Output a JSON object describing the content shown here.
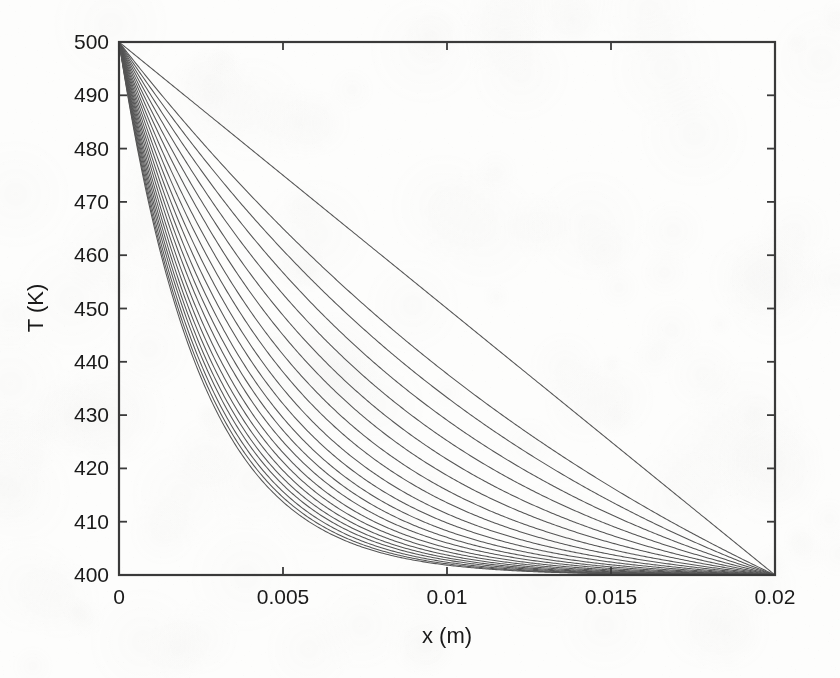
{
  "figure": {
    "background_color": "#fdfdfc",
    "axis_color": "#3a3a3a",
    "curve_color": "#555555",
    "text_color": "#1a1a1a"
  },
  "chart_data": {
    "type": "line",
    "title": "",
    "xlabel": "x (m)",
    "ylabel": "T (K)",
    "xlim": [
      0,
      0.02
    ],
    "ylim": [
      400,
      500
    ],
    "xticks": [
      0,
      0.005,
      0.01,
      0.015,
      0.02
    ],
    "xtick_labels": [
      "0",
      "0.005",
      "0.01",
      "0.015",
      "0.02"
    ],
    "yticks": [
      400,
      410,
      420,
      430,
      440,
      450,
      460,
      470,
      480,
      490,
      500
    ],
    "ytick_labels": [
      "400",
      "410",
      "420",
      "430",
      "440",
      "450",
      "460",
      "470",
      "480",
      "490",
      "500"
    ],
    "grid": false,
    "legend": null,
    "tick_direction": "in",
    "box": true,
    "n_curves": 22,
    "series": [
      {
        "name": "curve-1",
        "shape": "exponential-decay",
        "steepness": 1.0,
        "x": [
          0,
          0.001,
          0.002,
          0.003,
          0.004,
          0.005,
          0.006,
          0.007,
          0.008,
          0.009,
          0.01,
          0.012,
          0.014,
          0.016,
          0.018,
          0.02
        ],
        "values": [
          500.0,
          474.8,
          455.3,
          440.2,
          428.7,
          420.0,
          413.6,
          409.0,
          405.7,
          403.4,
          401.9,
          400.5,
          400.1,
          400.0,
          400.0,
          400.0
        ]
      },
      {
        "name": "curve-2",
        "shape": "exponential-decay",
        "steepness": 0.72,
        "x": [
          0,
          0.001,
          0.002,
          0.003,
          0.004,
          0.005,
          0.006,
          0.007,
          0.008,
          0.009,
          0.01,
          0.012,
          0.014,
          0.016,
          0.018,
          0.02
        ],
        "values": [
          500.0,
          481.5,
          466.1,
          453.3,
          442.8,
          434.2,
          427.2,
          421.5,
          417.0,
          413.3,
          410.4,
          406.4,
          404.0,
          402.4,
          401.2,
          400.0
        ]
      },
      {
        "name": "curve-3",
        "shape": "exponential-decay",
        "steepness": 0.56,
        "x": [
          0,
          0.001,
          0.002,
          0.003,
          0.004,
          0.005,
          0.006,
          0.007,
          0.008,
          0.009,
          0.01,
          0.012,
          0.014,
          0.016,
          0.018,
          0.02
        ],
        "values": [
          500.0,
          485.0,
          472.0,
          460.8,
          451.2,
          443.0,
          436.1,
          430.2,
          425.2,
          421.1,
          417.6,
          412.4,
          408.9,
          406.2,
          403.7,
          400.0
        ]
      },
      {
        "name": "curve-4",
        "shape": "exponential-decay",
        "steepness": 0.46,
        "x": [
          0,
          0.001,
          0.002,
          0.003,
          0.004,
          0.005,
          0.006,
          0.007,
          0.008,
          0.009,
          0.01,
          0.012,
          0.014,
          0.016,
          0.018,
          0.02
        ],
        "values": [
          500.0,
          487.0,
          475.6,
          465.6,
          456.8,
          449.1,
          442.4,
          436.6,
          431.6,
          427.2,
          423.5,
          417.5,
          413.2,
          409.7,
          406.3,
          400.0
        ]
      },
      {
        "name": "curve-5",
        "shape": "exponential-decay",
        "steepness": 0.39,
        "x": [
          0,
          0.001,
          0.002,
          0.003,
          0.004,
          0.005,
          0.006,
          0.007,
          0.008,
          0.009,
          0.01,
          0.012,
          0.014,
          0.016,
          0.018,
          0.02
        ],
        "values": [
          500.0,
          488.4,
          478.1,
          468.9,
          460.8,
          453.5,
          447.1,
          441.4,
          436.4,
          432.0,
          428.1,
          421.6,
          416.6,
          412.5,
          408.4,
          400.0
        ]
      },
      {
        "name": "curve-6",
        "shape": "exponential-decay",
        "steepness": 0.34,
        "x": [
          0,
          0.001,
          0.002,
          0.003,
          0.004,
          0.005,
          0.006,
          0.007,
          0.008,
          0.009,
          0.01,
          0.012,
          0.014,
          0.016,
          0.018,
          0.02
        ],
        "values": [
          500.0,
          489.4,
          479.9,
          471.4,
          463.8,
          457.0,
          450.8,
          445.3,
          440.4,
          436.0,
          432.0,
          425.1,
          419.6,
          415.0,
          410.2,
          400.0
        ]
      },
      {
        "name": "curve-7",
        "shape": "exponential-decay",
        "steepness": 0.3,
        "x": [
          0,
          0.001,
          0.002,
          0.003,
          0.004,
          0.005,
          0.006,
          0.007,
          0.008,
          0.009,
          0.01,
          0.012,
          0.014,
          0.016,
          0.018,
          0.02
        ],
        "values": [
          500.0,
          490.2,
          481.3,
          473.3,
          466.1,
          459.6,
          453.7,
          448.3,
          443.5,
          439.1,
          435.1,
          428.0,
          422.1,
          417.0,
          411.6,
          400.0
        ]
      },
      {
        "name": "curve-8",
        "shape": "exponential-decay",
        "steepness": 0.27,
        "x": [
          0,
          0.001,
          0.002,
          0.003,
          0.004,
          0.005,
          0.006,
          0.007,
          0.008,
          0.009,
          0.01,
          0.012,
          0.014,
          0.016,
          0.018,
          0.02
        ],
        "values": [
          500.0,
          490.9,
          482.5,
          474.9,
          468.0,
          461.7,
          455.9,
          450.7,
          445.9,
          441.5,
          437.5,
          430.3,
          424.2,
          418.8,
          412.8,
          400.0
        ]
      },
      {
        "name": "curve-9",
        "shape": "exponential-decay",
        "steepness": 0.245,
        "x": [
          0,
          0.001,
          0.002,
          0.003,
          0.004,
          0.005,
          0.006,
          0.007,
          0.008,
          0.009,
          0.01,
          0.012,
          0.014,
          0.016,
          0.018,
          0.02
        ],
        "values": [
          500.0,
          491.5,
          483.5,
          476.2,
          469.6,
          463.5,
          457.8,
          452.6,
          447.9,
          443.5,
          439.5,
          432.2,
          425.9,
          420.2,
          413.8,
          400.0
        ]
      },
      {
        "name": "curve-10",
        "shape": "exponential-decay",
        "steepness": 0.225,
        "x": [
          0,
          0.001,
          0.002,
          0.003,
          0.004,
          0.005,
          0.006,
          0.007,
          0.008,
          0.009,
          0.01,
          0.012,
          0.014,
          0.016,
          0.018,
          0.02
        ],
        "values": [
          500.0,
          492.0,
          484.3,
          477.3,
          470.9,
          464.9,
          459.4,
          454.2,
          449.5,
          445.1,
          441.1,
          433.7,
          427.2,
          421.4,
          414.7,
          400.0
        ]
      },
      {
        "name": "curve-11",
        "shape": "exponential-decay",
        "steepness": 0.208,
        "x": [
          0,
          0.001,
          0.002,
          0.003,
          0.004,
          0.005,
          0.006,
          0.007,
          0.008,
          0.009,
          0.01,
          0.012,
          0.014,
          0.016,
          0.018,
          0.02
        ],
        "values": [
          500.0,
          492.4,
          485.0,
          478.2,
          471.9,
          466.1,
          460.7,
          455.6,
          450.9,
          446.5,
          442.4,
          435.0,
          428.4,
          422.4,
          415.4,
          400.0
        ]
      },
      {
        "name": "curve-12",
        "shape": "exponential-decay",
        "steepness": 0.194,
        "x": [
          0,
          0.001,
          0.002,
          0.003,
          0.004,
          0.005,
          0.006,
          0.007,
          0.008,
          0.009,
          0.01,
          0.012,
          0.014,
          0.016,
          0.018,
          0.02
        ],
        "values": [
          500.0,
          492.8,
          485.6,
          479.0,
          472.8,
          467.1,
          461.8,
          456.8,
          452.1,
          447.7,
          443.6,
          436.1,
          429.4,
          423.2,
          416.0,
          400.0
        ]
      },
      {
        "name": "curve-13",
        "shape": "exponential-decay",
        "steepness": 0.182,
        "x": [
          0,
          0.001,
          0.002,
          0.003,
          0.004,
          0.005,
          0.006,
          0.007,
          0.008,
          0.009,
          0.01,
          0.012,
          0.014,
          0.016,
          0.018,
          0.02
        ],
        "values": [
          500.0,
          493.1,
          486.1,
          479.7,
          473.6,
          468.0,
          462.7,
          457.8,
          453.1,
          448.7,
          444.6,
          437.0,
          430.2,
          423.9,
          416.5,
          400.0
        ]
      },
      {
        "name": "curve-14",
        "shape": "exponential-decay",
        "steepness": 0.171,
        "x": [
          0,
          0.001,
          0.002,
          0.003,
          0.004,
          0.005,
          0.006,
          0.007,
          0.008,
          0.009,
          0.01,
          0.012,
          0.014,
          0.016,
          0.018,
          0.02
        ],
        "values": [
          500.0,
          493.4,
          486.6,
          480.3,
          474.3,
          468.8,
          463.6,
          458.7,
          454.0,
          449.6,
          445.5,
          437.8,
          430.9,
          424.5,
          416.9,
          400.0
        ]
      },
      {
        "name": "curve-15",
        "shape": "exponential-decay",
        "steepness": 0.162,
        "x": [
          0,
          0.001,
          0.002,
          0.003,
          0.004,
          0.005,
          0.006,
          0.007,
          0.008,
          0.009,
          0.01,
          0.012,
          0.014,
          0.016,
          0.018,
          0.02
        ],
        "values": [
          500.0,
          493.6,
          487.0,
          480.9,
          475.0,
          469.5,
          464.3,
          459.4,
          454.8,
          450.4,
          446.2,
          438.5,
          431.5,
          425.0,
          417.3,
          400.0
        ]
      },
      {
        "name": "curve-16",
        "shape": "exponential-decay",
        "steepness": 0.154,
        "x": [
          0,
          0.001,
          0.002,
          0.003,
          0.004,
          0.005,
          0.006,
          0.007,
          0.008,
          0.009,
          0.01,
          0.012,
          0.014,
          0.016,
          0.018,
          0.02
        ],
        "values": [
          500.0,
          493.8,
          487.4,
          481.4,
          475.6,
          470.1,
          465.0,
          460.1,
          455.5,
          451.1,
          446.9,
          439.1,
          432.0,
          425.5,
          417.6,
          400.0
        ]
      },
      {
        "name": "curve-17",
        "shape": "exponential-decay",
        "steepness": 0.147,
        "x": [
          0,
          0.001,
          0.002,
          0.003,
          0.004,
          0.005,
          0.006,
          0.007,
          0.008,
          0.009,
          0.01,
          0.012,
          0.014,
          0.016,
          0.018,
          0.02
        ],
        "values": [
          500.0,
          494.0,
          487.7,
          481.8,
          476.1,
          470.7,
          465.6,
          460.7,
          456.1,
          451.7,
          447.5,
          439.6,
          432.5,
          425.9,
          417.9,
          400.0
        ]
      },
      {
        "name": "curve-18",
        "shape": "exponential-decay",
        "steepness": 0.141,
        "x": [
          0,
          0.001,
          0.002,
          0.003,
          0.004,
          0.005,
          0.006,
          0.007,
          0.008,
          0.009,
          0.01,
          0.012,
          0.014,
          0.016,
          0.018,
          0.02
        ],
        "values": [
          500.0,
          494.2,
          488.0,
          482.2,
          476.6,
          471.2,
          466.1,
          461.3,
          456.6,
          452.2,
          448.0,
          440.1,
          432.9,
          426.2,
          418.2,
          400.0
        ]
      },
      {
        "name": "curve-19",
        "shape": "exponential-decay",
        "steepness": 0.135,
        "x": [
          0,
          0.001,
          0.002,
          0.003,
          0.004,
          0.005,
          0.006,
          0.007,
          0.008,
          0.009,
          0.01,
          0.012,
          0.014,
          0.016,
          0.018,
          0.02
        ],
        "values": [
          500.0,
          494.3,
          488.3,
          482.5,
          477.0,
          471.6,
          466.6,
          461.8,
          457.1,
          452.7,
          448.5,
          440.5,
          433.3,
          426.5,
          418.4,
          400.0
        ]
      },
      {
        "name": "curve-20",
        "shape": "exponential-decay",
        "steepness": 0.13,
        "x": [
          0,
          0.001,
          0.002,
          0.003,
          0.004,
          0.005,
          0.006,
          0.007,
          0.008,
          0.009,
          0.01,
          0.012,
          0.014,
          0.016,
          0.018,
          0.02
        ],
        "values": [
          500.0,
          494.5,
          488.5,
          482.8,
          477.4,
          472.1,
          467.0,
          462.2,
          457.5,
          453.1,
          448.9,
          440.9,
          433.6,
          426.8,
          418.6,
          400.0
        ]
      },
      {
        "name": "curve-21",
        "shape": "exponential-decay",
        "steepness": 0.126,
        "x": [
          0,
          0.001,
          0.002,
          0.003,
          0.004,
          0.005,
          0.006,
          0.007,
          0.008,
          0.009,
          0.01,
          0.012,
          0.014,
          0.016,
          0.018,
          0.02
        ],
        "values": [
          500.0,
          494.6,
          488.7,
          483.1,
          477.7,
          472.4,
          467.4,
          462.6,
          457.9,
          453.5,
          449.2,
          441.2,
          433.9,
          427.0,
          418.8,
          400.0
        ]
      },
      {
        "name": "curve-22-steady-state",
        "shape": "linear",
        "steepness": 0.0,
        "x": [
          0,
          0.001,
          0.002,
          0.003,
          0.004,
          0.005,
          0.006,
          0.007,
          0.008,
          0.009,
          0.01,
          0.012,
          0.014,
          0.016,
          0.018,
          0.02
        ],
        "values": [
          500.0,
          495.0,
          490.0,
          485.0,
          480.0,
          475.0,
          470.0,
          465.0,
          460.0,
          455.0,
          450.0,
          440.0,
          430.0,
          420.0,
          410.0,
          400.0
        ]
      }
    ]
  }
}
